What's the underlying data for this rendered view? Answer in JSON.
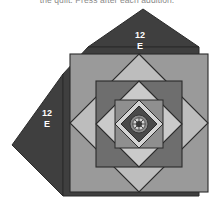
{
  "caption": {
    "text": "the quilt. Press after each addition."
  },
  "figure": {
    "name": "pineapple-quilt-block-diagram",
    "labels": [
      {
        "id": "top-corner-patch",
        "line1": "12",
        "line2": "E",
        "x": 140,
        "y": 40
      },
      {
        "id": "left-corner-patch",
        "line1": "12",
        "line2": "E",
        "x": 47,
        "y": 118
      }
    ],
    "colors": {
      "background": "#ffffff",
      "corner_dark": "#3f3f3f",
      "ring1_mid": "#9a9a9a",
      "ring2_light": "#b9b9b9",
      "ring3_dark": "#6e6e6e",
      "ring4_light": "#c9c9c9",
      "ring5_mid": "#8f8f8f",
      "ring6_light": "#d6d6d6",
      "center_dark": "#4a4a4a",
      "center_rosette_light": "#cfcfcf",
      "outline": "#2b2b2b",
      "label_text": "#ffffff"
    },
    "geometry": {
      "outer_square": {
        "x": 63,
        "y": 47,
        "size": 152
      },
      "center": {
        "x": 139,
        "y": 136
      }
    }
  }
}
